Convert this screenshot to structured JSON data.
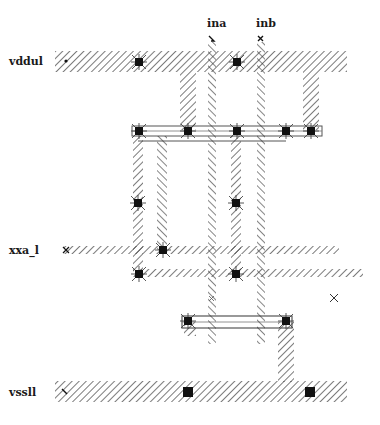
{
  "diagram": {
    "type": "ic-layout-stick",
    "colors": {
      "background": "#ffffff",
      "hatch": "#333333",
      "contact": "#111111",
      "text": "#1a1a1a"
    },
    "rails": [
      {
        "id": "vdd",
        "label": "vddul",
        "y": 62
      },
      {
        "id": "out",
        "label": "xxa_l",
        "y": 250
      },
      {
        "id": "vss",
        "label": "vssll",
        "y": 392
      }
    ],
    "inputs": [
      {
        "id": "ina",
        "label": "ina",
        "x": 212
      },
      {
        "id": "inb",
        "label": "inb",
        "x": 262
      }
    ],
    "markers": [
      {
        "id": "cross-marker",
        "symbol": "×",
        "x": 334,
        "y": 298
      }
    ]
  }
}
